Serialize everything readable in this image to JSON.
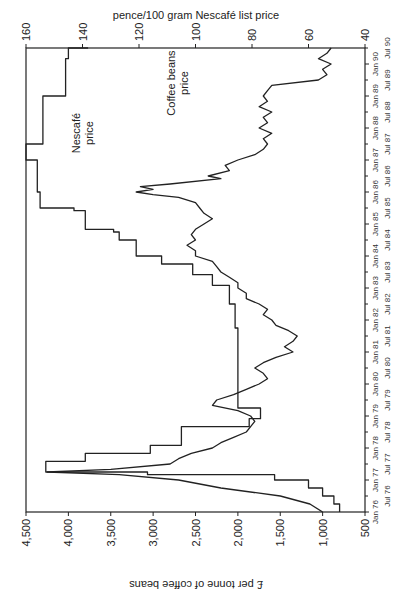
{
  "chart_data": {
    "type": "line",
    "title": "",
    "xlabel": "",
    "ylabel": "£ per tonne of coffee beans",
    "y2label": "pence/100 gram Nescafé list price",
    "orientation_note": "figure is displayed rotated 90° counter-clockwise",
    "x_range": [
      "Jan 76",
      "Jul 90"
    ],
    "ylim": [
      500,
      4500
    ],
    "y2lim": [
      40,
      160
    ],
    "grid": false,
    "legend": "inline annotations",
    "y_ticks": [
      "500",
      "1,000",
      "1,500",
      "2,000",
      "2,500",
      "3,000",
      "3,500",
      "4,000",
      "4,500"
    ],
    "y2_ticks": [
      "40",
      "60",
      "80",
      "100",
      "120",
      "140",
      "160"
    ],
    "x_ticks_upper": [
      "Jan 76",
      "Jan 77",
      "Jan 78",
      "Jan 79",
      "Jan 80",
      "Jan 81",
      "Jan 82",
      "Jan 83",
      "Jan 84",
      "Jan 85",
      "Jan 86",
      "Jan 87",
      "Jan 88",
      "Jan 89",
      "Jan 90"
    ],
    "x_ticks_lower": [
      "Jul 76",
      "Jul 77",
      "Jul 78",
      "Jul 79",
      "Jul 80",
      "Jul 81",
      "Jul 82",
      "Jul 83",
      "Jul 84",
      "Jul 85",
      "Jul 86",
      "Jul 87",
      "Jul 88",
      "Jul 89",
      "Jul 90"
    ],
    "series": [
      {
        "name": "Coffee beans price",
        "axis": "left",
        "unit": "£ per tonne",
        "style": "line",
        "points": [
          [
            "Jan 76",
            1000
          ],
          [
            "Apr 76",
            1150
          ],
          [
            "Jul 76",
            1500
          ],
          [
            "Oct 76",
            2200
          ],
          [
            "Jan 77",
            2700
          ],
          [
            "Mar 77",
            3400
          ],
          [
            "Apr 77",
            4250
          ],
          [
            "May 77",
            3500
          ],
          [
            "Jul 77",
            2800
          ],
          [
            "Sep 77",
            2700
          ],
          [
            "Nov 77",
            2550
          ],
          [
            "Jan 78",
            2300
          ],
          [
            "Mar 78",
            2200
          ],
          [
            "May 78",
            2050
          ],
          [
            "Jul 78",
            1900
          ],
          [
            "Sep 78",
            1850
          ],
          [
            "Nov 78",
            1800
          ],
          [
            "Jan 79",
            1850
          ],
          [
            "Mar 79",
            2000
          ],
          [
            "May 79",
            2300
          ],
          [
            "Jul 79",
            2250
          ],
          [
            "Sep 79",
            2050
          ],
          [
            "Nov 79",
            1900
          ],
          [
            "Jan 80",
            1750
          ],
          [
            "Mar 80",
            1650
          ],
          [
            "May 80",
            1700
          ],
          [
            "Jul 80",
            1800
          ],
          [
            "Sep 80",
            1700
          ],
          [
            "Nov 80",
            1550
          ],
          [
            "Jan 81",
            1350
          ],
          [
            "Mar 81",
            1450
          ],
          [
            "May 81",
            1350
          ],
          [
            "Jul 81",
            1300
          ],
          [
            "Sep 81",
            1400
          ],
          [
            "Nov 81",
            1550
          ],
          [
            "Jan 82",
            1600
          ],
          [
            "Mar 82",
            1700
          ],
          [
            "May 82",
            1650
          ],
          [
            "Jul 82",
            1750
          ],
          [
            "Sep 82",
            1900
          ],
          [
            "Nov 82",
            1900
          ],
          [
            "Jan 83",
            2000
          ],
          [
            "Mar 83",
            2000
          ],
          [
            "May 83",
            2100
          ],
          [
            "Jul 83",
            2200
          ],
          [
            "Sep 83",
            2250
          ],
          [
            "Nov 83",
            2300
          ],
          [
            "Jan 84",
            2500
          ],
          [
            "Mar 84",
            2500
          ],
          [
            "May 84",
            2600
          ],
          [
            "Jul 84",
            2500
          ],
          [
            "Sep 84",
            2550
          ],
          [
            "Nov 84",
            2500
          ],
          [
            "Jan 85",
            2400
          ],
          [
            "Mar 85",
            2300
          ],
          [
            "May 85",
            2400
          ],
          [
            "Jul 85",
            2450
          ],
          [
            "Sep 85",
            2500
          ],
          [
            "Nov 85",
            2700
          ],
          [
            "Dec 85",
            3000
          ],
          [
            "Jan 86",
            3200
          ],
          [
            "Feb 86",
            3000
          ],
          [
            "Mar 86",
            3150
          ],
          [
            "Apr 86",
            2800
          ],
          [
            "Jun 86",
            2200
          ],
          [
            "Jul 86",
            2350
          ],
          [
            "Sep 86",
            2100
          ],
          [
            "Nov 86",
            2150
          ],
          [
            "Jan 87",
            2000
          ],
          [
            "Mar 87",
            1800
          ],
          [
            "May 87",
            1700
          ],
          [
            "Jul 87",
            1650
          ],
          [
            "Sep 87",
            1700
          ],
          [
            "Nov 87",
            1600
          ],
          [
            "Jan 88",
            1750
          ],
          [
            "Mar 88",
            1650
          ],
          [
            "May 88",
            1700
          ],
          [
            "Jul 88",
            1600
          ],
          [
            "Sep 88",
            1750
          ],
          [
            "Nov 88",
            1650
          ],
          [
            "Jan 89",
            1700
          ],
          [
            "Mar 89",
            1650
          ],
          [
            "May 89",
            1600
          ],
          [
            "Jul 89",
            1050
          ],
          [
            "Sep 89",
            950
          ],
          [
            "Nov 89",
            1000
          ],
          [
            "Jan 90",
            900
          ],
          [
            "Mar 90",
            1050
          ],
          [
            "May 90",
            950
          ],
          [
            "Jul 90",
            900
          ]
        ]
      },
      {
        "name": "Nescafé price",
        "axis": "right",
        "unit": "pence/100 gram",
        "style": "step",
        "points": [
          [
            "Jan 76",
            49
          ],
          [
            "Apr 76",
            51
          ],
          [
            "Jul 76",
            55
          ],
          [
            "Oct 76",
            60
          ],
          [
            "Jan 77",
            72
          ],
          [
            "Mar 77",
            117
          ],
          [
            "Apr 77",
            153
          ],
          [
            "Jul 77",
            153
          ],
          [
            "Aug 77",
            139
          ],
          [
            "Nov 77",
            116
          ],
          [
            "Feb 78",
            105
          ],
          [
            "Jul 78",
            105
          ],
          [
            "Sep 78",
            81
          ],
          [
            "Dec 78",
            77
          ],
          [
            "Apr 79",
            85
          ],
          [
            "Jun 79",
            85
          ],
          [
            "Nov 79",
            85
          ],
          [
            "Jul 80",
            85
          ],
          [
            "Oct 81",
            86
          ],
          [
            "Jul 82",
            88
          ],
          [
            "Feb 83",
            94
          ],
          [
            "Jun 83",
            101
          ],
          [
            "Oct 83",
            112
          ],
          [
            "Jan 84",
            121
          ],
          [
            "Jul 84",
            127
          ],
          [
            "Oct 84",
            129
          ],
          [
            "Nov 84",
            139
          ],
          [
            "Jun 85",
            143
          ],
          [
            "Jul 85",
            155
          ],
          [
            "Jan 86",
            156
          ],
          [
            "Jan 87",
            160
          ],
          [
            "Jul 87",
            154
          ],
          [
            "Sep 88",
            154
          ],
          [
            "Jan 89",
            146
          ],
          [
            "Jul 89",
            146
          ],
          [
            "Mar 90",
            145
          ],
          [
            "Jul 90",
            138
          ]
        ]
      }
    ],
    "annotations": [
      {
        "text": [
          "Nescafé",
          "price"
        ],
        "series": "Nescafé price"
      },
      {
        "text": [
          "Coffee beans",
          "price"
        ],
        "series": "Coffee beans price"
      }
    ]
  },
  "labels": {
    "left_axis": "£ per tonne of coffee beans",
    "right_axis": "pence/100 gram Nescafé list price",
    "nescafe_line1": "Nescafé",
    "nescafe_line2": "price",
    "coffee_line1": "Coffee beans",
    "coffee_line2": "price"
  },
  "colors": {
    "line": "#222222",
    "axis": "#222222",
    "background": "#ffffff"
  }
}
